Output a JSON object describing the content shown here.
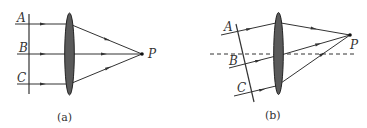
{
  "figure": {
    "panels": [
      {
        "id": "a",
        "caption": "(a)",
        "rays": [
          "A",
          "B",
          "C"
        ],
        "focus_label": "P",
        "wavefront": "perpendicular to optical axis"
      },
      {
        "id": "b",
        "caption": "(b)",
        "rays": [
          "A",
          "B",
          "C"
        ],
        "focus_label": "P",
        "wavefront": "tilted",
        "optical_axis": "dashed"
      }
    ]
  },
  "labels": {
    "a": {
      "A": "A",
      "B": "B",
      "C": "C",
      "P": "P",
      "caption": "(a)"
    },
    "b": {
      "A": "A",
      "B": "B",
      "C": "C",
      "P": "P",
      "caption": "(b)"
    }
  },
  "colors": {
    "line": "#333333",
    "lens_fill": "#5a5a5a",
    "lens_stroke": "#222222"
  }
}
